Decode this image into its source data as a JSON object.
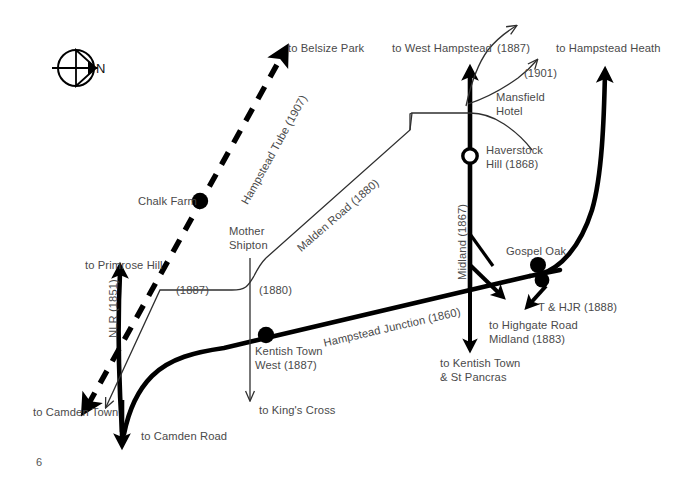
{
  "page": {
    "number": "6",
    "background": "#ffffff",
    "ink": "#000000",
    "text_color": "#4a4a4a"
  },
  "compass": {
    "label": "N",
    "name": "compass-rose",
    "points": "east-arrow-in-circle"
  },
  "lines": [
    {
      "id": "hampstead-tube",
      "label": "Hampstead Tube (1907)",
      "style": "dashed-thick",
      "year": "1907"
    },
    {
      "id": "nlr",
      "label": "NLR (1851)",
      "style": "solid-thick",
      "year": "1851"
    },
    {
      "id": "hampstead-junction",
      "label": "Hampstead Junction (1860)",
      "style": "solid-thick",
      "year": "1860"
    },
    {
      "id": "midland",
      "label": "Midland (1867)",
      "style": "solid-thick",
      "year": "1867"
    },
    {
      "id": "malden-road",
      "label": "Malden Road (1880)",
      "style": "solid-thin",
      "year": "1880"
    },
    {
      "id": "kt-branch-1880",
      "label": "(1880)",
      "style": "solid-thin",
      "year": "1880"
    },
    {
      "id": "branch-1887-west",
      "label": "(1887)",
      "style": "solid-thin",
      "year": "1887"
    },
    {
      "id": "branch-1887-north",
      "label": "(1887)",
      "style": "solid-thin",
      "year": "1887"
    },
    {
      "id": "branch-1901",
      "label": "(1901)",
      "style": "solid-thin",
      "year": "1901"
    },
    {
      "id": "t-and-hjr",
      "label": "T & HJR (1888)",
      "style": "arrow",
      "year": "1888"
    },
    {
      "id": "highgate-road",
      "label": "to Highgate Road\nMidland (1883)",
      "style": "arrow",
      "year": "1883"
    }
  ],
  "stations": [
    {
      "id": "chalk-farm",
      "label": "Chalk Farm",
      "marker": "filled-dot"
    },
    {
      "id": "kentish-town-west",
      "label": "Kentish Town\nWest (1887)",
      "marker": "filled-dot"
    },
    {
      "id": "haverstock-hill",
      "label": "Haverstock\nHill (1868)",
      "marker": "open-dot"
    },
    {
      "id": "gospel-oak",
      "label": "Gospel Oak",
      "marker": "filled-dot"
    },
    {
      "id": "mother-shipton",
      "label": "Mother\nShipton",
      "marker": "none"
    },
    {
      "id": "mansfield-hotel",
      "label": "Mansfield\nHotel",
      "marker": "none"
    }
  ],
  "destinations": [
    {
      "id": "to-belsize-park",
      "label": "to Belsize Park"
    },
    {
      "id": "to-west-hampstead",
      "label": "to West Hampstead"
    },
    {
      "id": "to-hampstead-heath",
      "label": "to Hampstead Heath"
    },
    {
      "id": "to-primrose-hill",
      "label": "to Primrose Hill"
    },
    {
      "id": "to-camden-town",
      "label": "to Camden Town"
    },
    {
      "id": "to-camden-road",
      "label": "to Camden Road"
    },
    {
      "id": "to-kings-cross",
      "label": "to King's Cross"
    },
    {
      "id": "to-kentish-town-st-pancras",
      "label": "to Kentish Town\n& St Pancras"
    },
    {
      "id": "to-highgate-road-midland",
      "label": "to Highgate Road\nMidland (1883)"
    }
  ],
  "labels": {
    "belsize_park": "to Belsize Park",
    "hampstead_tube": "Hampstead Tube (1907)",
    "chalk_farm": "Chalk Farm",
    "mother_shipton": "Mother\nShipton",
    "malden_road": "Malden Road (1880)",
    "west_hampstead": "to West Hampstead",
    "y1887_top": "(1887)",
    "y1901": "(1901)",
    "hampstead_heath": "to Hampstead Heath",
    "mansfield_hotel": "Mansfield\nHotel",
    "haverstock_hill": "Haverstock\nHill (1868)",
    "midland_1867": "Midland (1867)",
    "gospel_oak": "Gospel Oak",
    "t_and_hjr": "T & HJR (1888)",
    "highgate_road": "to Highgate Road\nMidland (1883)",
    "hampstead_junction": "Hampstead Junction (1860)",
    "kentish_town_west": "Kentish Town\nWest (1887)",
    "kings_cross": "to King's Cross",
    "kentish_town_st_pancras": "to Kentish Town\n& St Pancras",
    "primrose_hill": "to Primrose Hill",
    "nlr_1851": "NLR (1851)",
    "camden_town": "to Camden Town",
    "camden_road": "to Camden Road",
    "y1887_left": "(1887)",
    "y1880_mid": "(1880)",
    "compass_n": "N",
    "page_number": "6"
  }
}
